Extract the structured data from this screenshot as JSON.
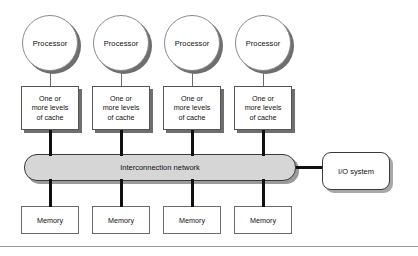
{
  "diagram": {
    "colors": {
      "network_fill": "#d6d6d6",
      "box_fill": "#ffffff",
      "shadow": "#6e6e6e",
      "outline": "#3a3a3a",
      "connector": "#101010"
    },
    "processors": [
      {
        "label": "Processor"
      },
      {
        "label": "Processor"
      },
      {
        "label": "Processor"
      },
      {
        "label": "Processor"
      }
    ],
    "caches": [
      {
        "line1": "One or",
        "line2": "more levels",
        "line3": "of cache"
      },
      {
        "line1": "One or",
        "line2": "more levels",
        "line3": "of cache"
      },
      {
        "line1": "One or",
        "line2": "more levels",
        "line3": "of cache"
      },
      {
        "line1": "One or",
        "line2": "more levels",
        "line3": "of cache"
      }
    ],
    "network": {
      "label": "Interconnection network"
    },
    "io": {
      "label": "I/O system"
    },
    "memories": [
      {
        "label": "Memory"
      },
      {
        "label": "Memory"
      },
      {
        "label": "Memory"
      },
      {
        "label": "Memory"
      }
    ]
  }
}
